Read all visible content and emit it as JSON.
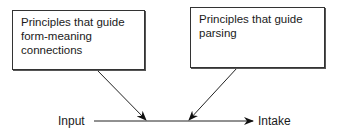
{
  "diagram": {
    "boxes": [
      {
        "id": "form-meaning",
        "text": "Principles that guide form-meaning connections",
        "lines": [
          "Principles that guide",
          "form-meaning",
          "connections"
        ]
      },
      {
        "id": "parsing",
        "text": "Principles that guide parsing",
        "lines": [
          "Principles that guide",
          "parsing"
        ]
      }
    ],
    "flow": {
      "source": "Input",
      "target": "Intake"
    },
    "edges": [
      {
        "from": "form-meaning",
        "to": "input-intake-line"
      },
      {
        "from": "parsing",
        "to": "input-intake-line"
      },
      {
        "from": "Input",
        "to": "Intake"
      }
    ]
  }
}
